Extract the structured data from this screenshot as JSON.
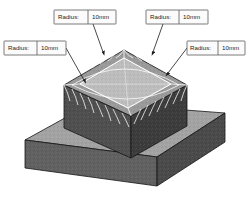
{
  "drawing": {
    "type": "cad-isometric-view",
    "title": "Fillet radius callouts on pedestal",
    "model": {
      "parts": [
        {
          "name": "base-slab",
          "shape": "rectangular-plate"
        },
        {
          "name": "upper-block",
          "shape": "filleted-box"
        }
      ],
      "feature": "top-edge-fillet",
      "mesh": "wireframe-fillet-isolines"
    },
    "colors": {
      "top_face": "#b9b9b9",
      "left_face": "#4f4f4f",
      "right_face": "#3c3c3c",
      "base_top": "#a3a3a3",
      "base_left": "#616161",
      "base_right": "#4a4a4a",
      "fillet_band": "#8a8a8a",
      "wireframe": "#ffffff",
      "outline": "#111111",
      "leader": "#2a2a2a",
      "label_border": "#5a5a5a",
      "label_fill": "#fbfbfb",
      "label_text": "#1c1c1c"
    }
  },
  "callouts": [
    {
      "id": "callout-top-left",
      "key_label": "Radius:",
      "value_label": "10mm",
      "box": {
        "x": 54,
        "y": 10,
        "w": 62,
        "h": 14,
        "divider_x": 34
      },
      "leader": {
        "from_x": 93,
        "from_y": 24,
        "to_x": 103,
        "to_y": 52
      },
      "arrow_x": 103,
      "arrow_y": 52
    },
    {
      "id": "callout-top-right",
      "key_label": "Radius:",
      "value_label": "10mm",
      "box": {
        "x": 146,
        "y": 10,
        "w": 62,
        "h": 14,
        "divider_x": 33
      },
      "leader": {
        "from_x": 163,
        "from_y": 24,
        "to_x": 153,
        "to_y": 52
      },
      "arrow_x": 153,
      "arrow_y": 52
    },
    {
      "id": "callout-left",
      "key_label": "Radius:",
      "value_label": "10mm",
      "box": {
        "x": 4,
        "y": 41,
        "w": 62,
        "h": 14,
        "divider_x": 33
      },
      "leader": {
        "from_x": 66,
        "from_y": 48,
        "to_x": 84,
        "to_y": 80
      },
      "arrow_x": 84,
      "arrow_y": 80
    },
    {
      "id": "callout-right",
      "key_label": "Radius:",
      "value_label": "10mm",
      "box": {
        "x": 187,
        "y": 41,
        "w": 58,
        "h": 14,
        "divider_x": 31
      },
      "leader": {
        "from_x": 187,
        "from_y": 48,
        "to_x": 168,
        "to_y": 73
      },
      "arrow_x": 168,
      "arrow_y": 73
    }
  ]
}
